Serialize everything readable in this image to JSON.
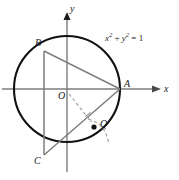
{
  "figure": {
    "background": "#ffffff",
    "axes": {
      "x_label": "x",
      "y_label": "y",
      "origin_label": "O",
      "axis_color": "#7d7d7d"
    },
    "circle": {
      "equation_text": "x² + y² = 1",
      "equation_parts": {
        "x_var": "x",
        "x_exp": "2",
        "plus": "+",
        "y_var": "y",
        "y_exp": "2",
        "equals": "=",
        "value": "1"
      },
      "color": "#111111",
      "center_label": "O",
      "radius_value": "1"
    },
    "points": [
      {
        "id": "A",
        "label": "A",
        "x": 120,
        "y": 89
      },
      {
        "id": "B",
        "label": "B",
        "x": 44,
        "y": 51
      },
      {
        "id": "C",
        "label": "C",
        "x": 44,
        "y": 155
      },
      {
        "id": "O",
        "label": "O",
        "x": 67,
        "y": 89
      },
      {
        "id": "Q",
        "label": "Q",
        "x": 94,
        "y": 127
      }
    ],
    "segments": [
      {
        "id": "BA",
        "from": "B",
        "to": "A",
        "style": "solid",
        "color": "#7d7d7d"
      },
      {
        "id": "BC",
        "from": "B",
        "to": "C",
        "style": "solid",
        "color": "#7d7d7d"
      },
      {
        "id": "CA",
        "from": "C",
        "to": "A",
        "style": "solid",
        "color": "#7d7d7d"
      },
      {
        "id": "OQ",
        "from": "O",
        "to": "Q",
        "style": "dashed",
        "color": "#9a9a9a"
      }
    ],
    "marks": {
      "point_q_style": "filled-dot",
      "dashed_arc": true,
      "right_angle_tick": true
    }
  }
}
